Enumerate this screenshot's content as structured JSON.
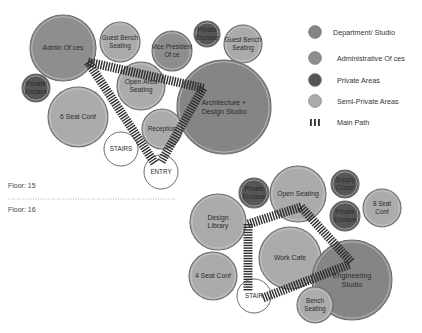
{
  "colors": {
    "department_studio": "#858585",
    "administrative_offices": "#8e8e8e",
    "private_areas": "#565656",
    "semi_private_areas": "#ababab",
    "stairs_entry": "#ffffff",
    "path": "#2e2e2e",
    "circle_outline": "#6a6a6a"
  },
  "legend": {
    "items": [
      {
        "label": "Department/ Studio",
        "type": "department_studio"
      },
      {
        "label": "Administrative Of ces",
        "type": "administrative_offices"
      },
      {
        "label": "Private Areas",
        "type": "private_areas"
      },
      {
        "label": "Semi-Private Areas",
        "type": "semi_private_areas"
      },
      {
        "label": "Main Path",
        "type": "path"
      }
    ]
  },
  "floors": {
    "upper_label": "Floor: 15",
    "lower_label": "Floor: 16"
  },
  "floor15": {
    "spaces": [
      {
        "name": "admin-offices",
        "lines": [
          "Admin Of  ces"
        ],
        "type": "administrative_offices",
        "cx": 63,
        "cy": 48,
        "r": 33
      },
      {
        "name": "guest-bench-seating-left",
        "lines": [
          "Guest Bench",
          "Seating"
        ],
        "type": "semi_private_areas",
        "cx": 120,
        "cy": 42,
        "r": 20
      },
      {
        "name": "vice-president-office",
        "lines": [
          "Vice President",
          "Of ce"
        ],
        "type": "administrative_offices",
        "cx": 172,
        "cy": 51,
        "r": 20
      },
      {
        "name": "private-enclave-top",
        "lines": [
          "Private",
          "Enclave"
        ],
        "type": "private_areas",
        "cx": 207,
        "cy": 34,
        "r": 13
      },
      {
        "name": "guest-bench-seating-right",
        "lines": [
          "Guest Bench",
          "Seating"
        ],
        "type": "semi_private_areas",
        "cx": 243,
        "cy": 44,
        "r": 19
      },
      {
        "name": "private-enclave-left",
        "lines": [
          "Private",
          "Enclave"
        ],
        "type": "private_areas",
        "cx": 36,
        "cy": 88,
        "r": 14
      },
      {
        "name": "six-seat-conf",
        "lines": [
          "6 Seat Conf"
        ],
        "type": "semi_private_areas",
        "cx": 78,
        "cy": 117,
        "r": 30
      },
      {
        "name": "open-area-seating",
        "lines": [
          "Open Area",
          "Seating"
        ],
        "type": "semi_private_areas",
        "cx": 141,
        "cy": 86,
        "r": 24
      },
      {
        "name": "architecture-design-studio",
        "lines": [
          "Architecture +",
          "Design Studio"
        ],
        "type": "department_studio",
        "cx": 224,
        "cy": 107,
        "r": 47
      },
      {
        "name": "reception",
        "lines": [
          "Reception"
        ],
        "type": "semi_private_areas",
        "cx": 162,
        "cy": 129,
        "r": 20
      },
      {
        "name": "stairs",
        "lines": [
          "STAIRS"
        ],
        "type": "stairs_entry",
        "cx": 121,
        "cy": 149,
        "r": 17
      },
      {
        "name": "entry",
        "lines": [
          "ENTRY"
        ],
        "type": "stairs_entry",
        "cx": 161,
        "cy": 172,
        "r": 17
      }
    ],
    "paths": [
      {
        "x1": 88,
        "y1": 62,
        "x2": 203,
        "y2": 88
      },
      {
        "x1": 88,
        "y1": 62,
        "x2": 154,
        "y2": 162
      },
      {
        "x1": 203,
        "y1": 88,
        "x2": 161,
        "y2": 162
      }
    ]
  },
  "floor16": {
    "spaces": [
      {
        "name": "private-enclave-a",
        "lines": [
          "Private",
          "Enclave"
        ],
        "type": "private_areas",
        "cx": 254,
        "cy": 193,
        "r": 15
      },
      {
        "name": "open-seating",
        "lines": [
          "Open Seating"
        ],
        "type": "semi_private_areas",
        "cx": 298,
        "cy": 194,
        "r": 28
      },
      {
        "name": "supply-closet",
        "lines": [
          "Supply",
          "Closet"
        ],
        "type": "private_areas",
        "cx": 345,
        "cy": 184,
        "r": 14
      },
      {
        "name": "eight-seat-conf",
        "lines": [
          "8 Seat",
          "Conf"
        ],
        "type": "semi_private_areas",
        "cx": 382,
        "cy": 208,
        "r": 19
      },
      {
        "name": "private-enclave-b",
        "lines": [
          "Private",
          "Enclave"
        ],
        "type": "private_areas",
        "cx": 345,
        "cy": 216,
        "r": 15
      },
      {
        "name": "design-library",
        "lines": [
          "Design",
          "Library"
        ],
        "type": "semi_private_areas",
        "cx": 218,
        "cy": 222,
        "r": 28
      },
      {
        "name": "work-cafe",
        "lines": [
          "Work Cafe"
        ],
        "type": "semi_private_areas",
        "cx": 290,
        "cy": 258,
        "r": 31
      },
      {
        "name": "engineering-studio",
        "lines": [
          "Engineering",
          "Studio"
        ],
        "type": "department_studio",
        "cx": 352,
        "cy": 280,
        "r": 40
      },
      {
        "name": "four-seat-conf",
        "lines": [
          "4 Seat Conf"
        ],
        "type": "semi_private_areas",
        "cx": 213,
        "cy": 276,
        "r": 24
      },
      {
        "name": "stair",
        "lines": [
          "STAIR"
        ],
        "type": "stairs_entry",
        "cx": 254,
        "cy": 296,
        "r": 17
      },
      {
        "name": "bench-seating",
        "lines": [
          "Bench",
          "Seating"
        ],
        "type": "semi_private_areas",
        "cx": 315,
        "cy": 305,
        "r": 18
      }
    ],
    "paths": [
      {
        "x1": 248,
        "y1": 224,
        "x2": 301,
        "y2": 207
      },
      {
        "x1": 301,
        "y1": 207,
        "x2": 351,
        "y2": 262
      },
      {
        "x1": 248,
        "y1": 224,
        "x2": 248,
        "y2": 291
      },
      {
        "x1": 263,
        "y1": 298,
        "x2": 348,
        "y2": 265
      }
    ]
  }
}
